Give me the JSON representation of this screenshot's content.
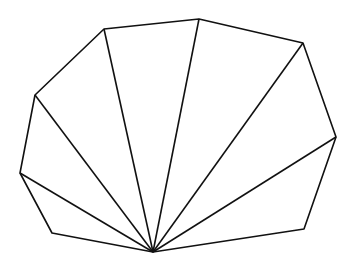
{
  "diagram": {
    "type": "polygon-fan-triangulation",
    "stroke_color": "#111111",
    "background": "#ffffff",
    "apex": {
      "x": 153,
      "y": 252
    },
    "vertices": [
      {
        "x": 153,
        "y": 252
      },
      {
        "x": 52,
        "y": 233
      },
      {
        "x": 20,
        "y": 173
      },
      {
        "x": 35,
        "y": 95
      },
      {
        "x": 104,
        "y": 29
      },
      {
        "x": 199,
        "y": 19
      },
      {
        "x": 303,
        "y": 43
      },
      {
        "x": 336,
        "y": 137
      },
      {
        "x": 304,
        "y": 229
      }
    ],
    "diagonals_to": [
      2,
      3,
      4,
      5,
      6,
      7
    ]
  }
}
